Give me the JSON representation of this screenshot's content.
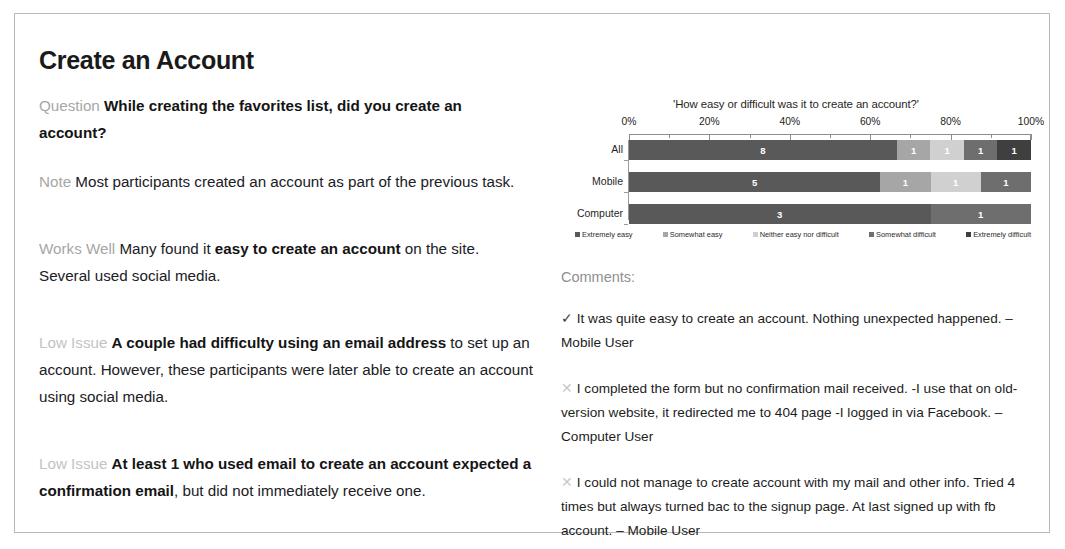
{
  "page": {
    "title": "Create an Account"
  },
  "findings": [
    {
      "tag": "Question",
      "tag_style": "normal",
      "parts": [
        {
          "text": "While creating the favorites list, did you create an account?",
          "bold": true
        }
      ]
    },
    {
      "tag": "Note",
      "tag_style": "normal",
      "parts": [
        {
          "text": "Most participants created an account as part of the previous task.",
          "bold": false
        }
      ]
    },
    {
      "tag": "Works Well",
      "tag_style": "normal",
      "parts": [
        {
          "text": "Many found it ",
          "bold": false
        },
        {
          "text": "easy to create an account",
          "bold": true
        },
        {
          "text": " on the site. Several used social media.",
          "bold": false
        }
      ]
    },
    {
      "tag": "Low Issue",
      "tag_style": "faint",
      "parts": [
        {
          "text": "A couple had ",
          "bold": true
        },
        {
          "text": "difficulty using an email address",
          "bold": true
        },
        {
          "text": " to set up an account. However, these participants were later able to create an account using social media.",
          "bold": false
        }
      ]
    },
    {
      "tag": "Low Issue",
      "tag_style": "faint",
      "parts": [
        {
          "text": "At least 1 who used email to create an account ",
          "bold": true
        },
        {
          "text": "expected a confirmation email",
          "bold": true
        },
        {
          "text": ", but did not immediately receive one.",
          "bold": false
        }
      ]
    }
  ],
  "chart_data": {
    "type": "bar",
    "orientation": "horizontal",
    "stacked": true,
    "normalized": true,
    "title": "'How easy or difficult was it to create an account?'",
    "xlabel": "",
    "ylabel": "",
    "xlim": [
      0,
      100
    ],
    "xticks": [
      0,
      20,
      40,
      60,
      80,
      100
    ],
    "xtick_labels": [
      "0%",
      "20%",
      "40%",
      "60%",
      "80%",
      "100%"
    ],
    "minor_tick_step": 10,
    "grid": false,
    "legend_position": "bottom",
    "categories": [
      "All",
      "Mobile",
      "Computer"
    ],
    "series": [
      {
        "name": "Extremely easy",
        "color": "#595959",
        "values": [
          8,
          5,
          3
        ]
      },
      {
        "name": "Somewhat easy",
        "color": "#a6a6a6",
        "values": [
          1,
          1,
          0
        ]
      },
      {
        "name": "Neither easy nor difficult",
        "color": "#d0d0d0",
        "values": [
          1,
          1,
          0
        ]
      },
      {
        "name": "Somewhat difficult",
        "color": "#6e6e6e",
        "values": [
          1,
          1,
          1
        ]
      },
      {
        "name": "Extremely difficult",
        "color": "#3f3f3f",
        "values": [
          1,
          0,
          0
        ]
      }
    ],
    "row_totals": [
      12,
      8,
      4
    ],
    "value_labels": {
      "All": [
        "8",
        "1",
        "1",
        "1",
        "1"
      ],
      "Mobile": [
        "5",
        "1",
        "1",
        "1",
        ""
      ],
      "Computer": [
        "3",
        "",
        "",
        "1",
        ""
      ]
    }
  },
  "comments": {
    "heading": "Comments:",
    "items": [
      {
        "mark": "✓",
        "mark_type": "check",
        "text": "It was quite easy to create an account. Nothing unexpected happened. – Mobile User"
      },
      {
        "mark": "✕",
        "mark_type": "x",
        "text": "I completed the form but no confirmation mail received. -I use that on old-version website, it redirected me to 404 page -I logged in via Facebook. – Computer User"
      },
      {
        "mark": "✕",
        "mark_type": "x",
        "text": "I could not manage to create account with my mail and other info. Tried 4 times but always turned bac to the signup page. At last signed up with fb account. – Mobile User"
      }
    ]
  }
}
